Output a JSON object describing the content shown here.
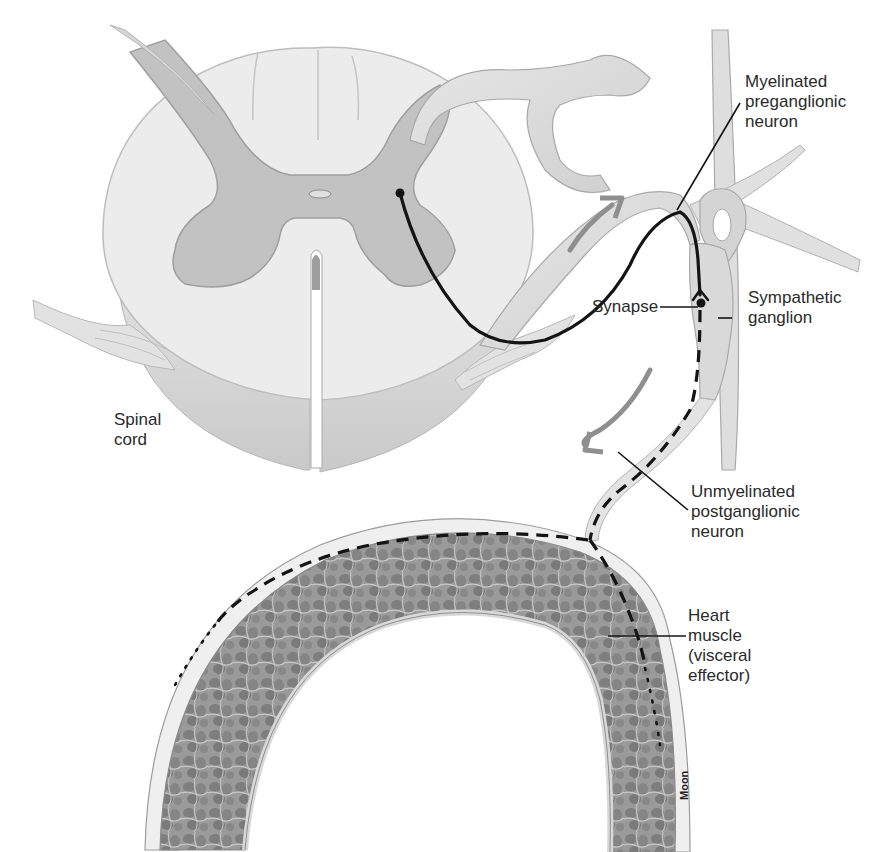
{
  "diagram": {
    "colors": {
      "background": "#ffffff",
      "white_matter": "#ececec",
      "gray_matter": "#bdbdbd",
      "nerve": "#d9d9d9",
      "nerve_edge": "#a8a8a8",
      "neuron_line": "#141414",
      "arrow": "#8f8f8f",
      "muscle": "#8d8d8d",
      "label_text": "#2a2a2a"
    },
    "labels": {
      "preganglionic": {
        "lines": [
          "Myelinated",
          "preganglionic",
          "neuron"
        ]
      },
      "ganglion": {
        "lines": [
          "Sympathetic",
          "ganglion"
        ]
      },
      "synapse": {
        "lines": [
          "Synapse"
        ]
      },
      "postganglionic": {
        "lines": [
          "Unmyelinated",
          "postganglionic",
          "neuron"
        ]
      },
      "heart": {
        "lines": [
          "Heart",
          "muscle",
          "(visceral",
          "effector)"
        ]
      },
      "spinal_cord": {
        "lines": [
          "Spinal",
          "cord"
        ]
      }
    },
    "credit": "Moon",
    "arrows": [
      {
        "name": "impulse-direction-toward-ganglion",
        "direction": "up-right"
      },
      {
        "name": "impulse-direction-toward-heart",
        "direction": "down-left"
      }
    ]
  }
}
